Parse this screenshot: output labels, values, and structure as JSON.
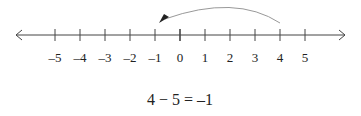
{
  "number_line": {
    "min": -5,
    "max": 5,
    "ticks": [
      -5,
      -4,
      -3,
      -2,
      -1,
      0,
      1,
      2,
      3,
      4,
      5
    ],
    "tick_labels": [
      "–5",
      "–4",
      "–3",
      "–2",
      "–1",
      "0",
      "1",
      "2",
      "3",
      "4",
      "5"
    ],
    "both_ends_arrows": true
  },
  "jump_arrow": {
    "from": 4,
    "to": -1,
    "direction": "left",
    "length": 5
  },
  "equation": "4 − 5 = –1",
  "colors": {
    "line": "#333333",
    "arrow": "#888888",
    "text": "#222222"
  }
}
